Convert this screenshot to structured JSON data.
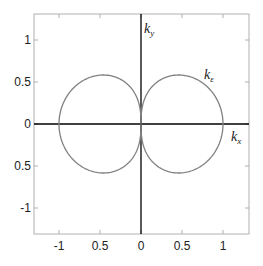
{
  "chart_data": {
    "type": "line",
    "title": "",
    "xlabel": "",
    "ylabel": "",
    "xlim": [
      -1.3,
      1.3
    ],
    "ylim": [
      -1.3,
      1.3
    ],
    "grid": false,
    "x_ticks": [
      -1,
      -0.5,
      0,
      0.5,
      1
    ],
    "x_tick_labels": [
      "-1",
      "0.5",
      "0",
      "0.5",
      "1"
    ],
    "y_ticks": [
      1,
      0.5,
      0,
      -0.5,
      -1
    ],
    "y_tick_labels": [
      "1",
      "0.5",
      "0",
      "0.5",
      "-1"
    ],
    "axis_labels": {
      "kx": {
        "main": "k",
        "sub": "x"
      },
      "ky": {
        "main": "k",
        "sub": "y"
      }
    },
    "series": [
      {
        "name": "kε",
        "label_main": "k",
        "label_sub": "ε",
        "description": "two-lobed polar curve, lobes touching at origin, extending to kx = ±1, max |ky| ≈ 0.58 near kx ≈ ±0.46",
        "polar_exponent": 0.62,
        "color": "#808080"
      }
    ],
    "colors": {
      "frame": "#b0b0b0",
      "axes": "#000000",
      "curve": "#808080"
    }
  }
}
